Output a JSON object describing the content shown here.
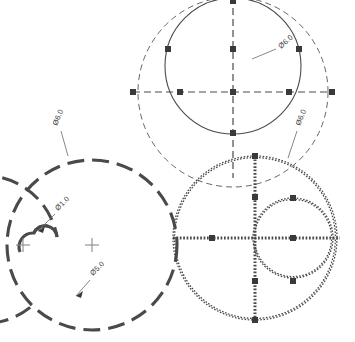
{
  "drawing": {
    "title": "Technical Drawing - Circle Construction",
    "background_color": "#ffffff",
    "line_color_bold": "#4a4a4a",
    "line_color_thin": "#555555",
    "marker_color": "#3a3a3a",
    "text_color": "#3a3a3a",
    "width": 355,
    "height": 342
  },
  "groups": [
    {
      "id": "top-group",
      "name": "top-circle-group",
      "center": {
        "x": 233,
        "y": 92
      },
      "outer_circle": {
        "radius": 95,
        "style": "dashed",
        "weight": "thin"
      },
      "inner_circle": {
        "radius": 68,
        "style": "solid",
        "weight": "thin",
        "center_y_offset": -26
      },
      "centerline_style": "dashed",
      "markers": 9
    },
    {
      "id": "left-group",
      "name": "lower-left-circle-group",
      "center": {
        "x": 92,
        "y": 245
      },
      "outer_circle": {
        "radius": 85,
        "style": "dashed",
        "weight": "bold"
      },
      "spiral_arc": {
        "style": "dashed",
        "weight": "bold"
      },
      "small_circle": {
        "radius": 12,
        "center": {
          "x": 22,
          "y": 235
        },
        "style": "solid",
        "weight": "bold"
      },
      "crosshairs": 2
    },
    {
      "id": "right-group",
      "name": "lower-right-circle-group",
      "center": {
        "x": 255,
        "y": 238
      },
      "outer_circle": {
        "radius": 82,
        "style": "zigzag",
        "weight": "bold"
      },
      "inner_circle": {
        "radius": 40,
        "center": {
          "x": 293,
          "y": 238
        },
        "style": "zigzag",
        "weight": "bold"
      },
      "centerline_style": "zigzag",
      "markers": 8
    }
  ],
  "labels": [
    {
      "id": "label-top-right",
      "text": "Ø6.0",
      "x": 281,
      "y": 49,
      "rotation": -42,
      "leader": {
        "x1": 252,
        "y1": 59,
        "x2": 276,
        "y2": 49
      }
    },
    {
      "id": "label-left-upper",
      "text": "Ø6.0",
      "x": 57,
      "y": 126,
      "rotation": -68,
      "leader": {
        "x1": 68,
        "y1": 156,
        "x2": 61,
        "y2": 131
      }
    },
    {
      "id": "label-right-upper",
      "text": "Ø6.0",
      "x": 300,
      "y": 126,
      "rotation": -68,
      "leader": {
        "x1": 288,
        "y1": 158,
        "x2": 297,
        "y2": 131
      }
    },
    {
      "id": "label-d1",
      "text": "Ø1.0",
      "x": 58,
      "y": 211,
      "rotation": -45,
      "leader": {
        "x1": 38,
        "y1": 231,
        "x2": 55,
        "y2": 214
      }
    },
    {
      "id": "label-d5",
      "text": "Ø5.0",
      "x": 93,
      "y": 276,
      "rotation": -45,
      "leader": {
        "x1": 76,
        "y1": 296,
        "x2": 90,
        "y2": 280
      }
    }
  ],
  "annotations": {
    "diameter_symbol": "Ø",
    "crosshair_marker": "plus-marker",
    "node_marker": "square-marker"
  }
}
